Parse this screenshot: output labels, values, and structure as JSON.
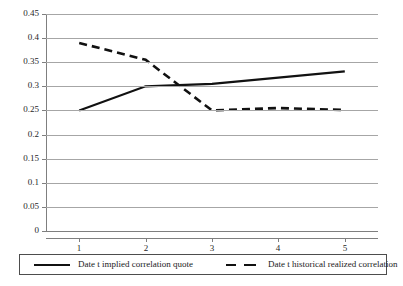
{
  "chart_data": {
    "type": "line",
    "title": "",
    "xlabel": "",
    "ylabel": "",
    "x": [
      1,
      2,
      3,
      4,
      5
    ],
    "xticklabels": [
      "1",
      "2",
      "3",
      "4",
      "5"
    ],
    "xlim": [
      0.5,
      5.5
    ],
    "ylim": [
      0,
      0.45
    ],
    "yticks": [
      0,
      0.05,
      0.1,
      0.15,
      0.2,
      0.25,
      0.3,
      0.35,
      0.4,
      0.45
    ],
    "yticklabels": [
      "0",
      "0.05",
      "0.1",
      "0.15",
      "0.2",
      "0.25",
      "0.3",
      "0.35",
      "0.4",
      "0.45"
    ],
    "grid": "horizontal",
    "legend_position": "bottom",
    "series": [
      {
        "name": "Date t implied correlation quote",
        "style": "solid",
        "color": "#111111",
        "values": [
          0.25,
          0.3,
          0.305,
          0.318,
          0.331
        ]
      },
      {
        "name": "Date t historical realized correlation",
        "style": "dashed",
        "color": "#111111",
        "values": [
          0.39,
          0.355,
          0.25,
          0.255,
          0.251
        ]
      }
    ]
  },
  "legend": {
    "entries": [
      {
        "label": "Date t implied correlation quote",
        "swatch": "solid-line-swatch"
      },
      {
        "label": "Date t historical realized correlation",
        "swatch": "dashed-line-swatch"
      }
    ]
  },
  "colors": {
    "gridline": "#a6a6a6",
    "axis": "#7f7f7f",
    "series": "#111111",
    "text": "#1a1a1a",
    "background": "#ffffff"
  }
}
